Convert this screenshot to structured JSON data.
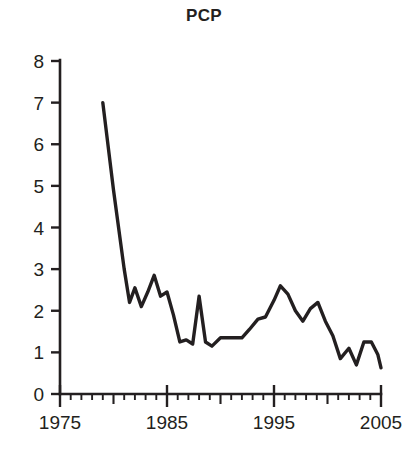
{
  "chart": {
    "title": "PCP"
  },
  "chart_data": {
    "type": "line",
    "title": "PCP",
    "xlabel": "",
    "ylabel": "",
    "xlim": [
      1975,
      2005
    ],
    "ylim": [
      0,
      8
    ],
    "grid": false,
    "legend": null,
    "x_ticks": [
      1975,
      1985,
      1995,
      2005
    ],
    "x_tick_labels": [
      "1975",
      "1985",
      "1995",
      "2005"
    ],
    "x_minor_tick_step": 1,
    "x_mid_tick_step": 5,
    "y_ticks": [
      0,
      1,
      2,
      3,
      4,
      5,
      6,
      7,
      8
    ],
    "y_tick_labels": [
      "0",
      "1",
      "2",
      "3",
      "4",
      "5",
      "6",
      "7",
      "8"
    ],
    "line_color": "#231f20",
    "x": [
      1979,
      1980,
      1981,
      1981.5,
      1982,
      1982.6,
      1983.2,
      1983.8,
      1984.4,
      1985,
      1985.6,
      1986.2,
      1986.8,
      1987.4,
      1988,
      1988.6,
      1989.2,
      1990,
      1990.6,
      1991.3,
      1992,
      1992.7,
      1993.5,
      1994.2,
      1995,
      1995.6,
      1996.3,
      1997,
      1997.7,
      1998.4,
      1999.1,
      1999.8,
      2000.5,
      2001.2,
      2002,
      2002.7,
      2003.4,
      2004.1,
      2004.7,
      2005
    ],
    "y": [
      7.0,
      4.9,
      3.0,
      2.2,
      2.55,
      2.1,
      2.45,
      2.85,
      2.35,
      2.45,
      1.9,
      1.25,
      1.3,
      1.2,
      2.35,
      1.25,
      1.15,
      1.35,
      1.35,
      1.35,
      1.35,
      1.55,
      1.8,
      1.85,
      2.25,
      2.6,
      2.4,
      2.0,
      1.75,
      2.05,
      2.2,
      1.75,
      1.4,
      0.85,
      1.1,
      0.7,
      1.25,
      1.25,
      0.95,
      0.63
    ],
    "series": [
      {
        "name": "PCP",
        "points": [
          {
            "x": 1979,
            "y": 7.0
          },
          {
            "x": 1980,
            "y": 4.9
          },
          {
            "x": 1981,
            "y": 3.0
          },
          {
            "x": 1981.5,
            "y": 2.2
          },
          {
            "x": 1982,
            "y": 2.55
          },
          {
            "x": 1982.6,
            "y": 2.1
          },
          {
            "x": 1983.2,
            "y": 2.45
          },
          {
            "x": 1983.8,
            "y": 2.85
          },
          {
            "x": 1984.4,
            "y": 2.35
          },
          {
            "x": 1985,
            "y": 2.45
          },
          {
            "x": 1985.6,
            "y": 1.9
          },
          {
            "x": 1986.2,
            "y": 1.25
          },
          {
            "x": 1986.8,
            "y": 1.3
          },
          {
            "x": 1987.4,
            "y": 1.2
          },
          {
            "x": 1988,
            "y": 2.35
          },
          {
            "x": 1988.6,
            "y": 1.25
          },
          {
            "x": 1989.2,
            "y": 1.15
          },
          {
            "x": 1990,
            "y": 1.35
          },
          {
            "x": 1990.6,
            "y": 1.35
          },
          {
            "x": 1991.3,
            "y": 1.35
          },
          {
            "x": 1992,
            "y": 1.35
          },
          {
            "x": 1992.7,
            "y": 1.55
          },
          {
            "x": 1993.5,
            "y": 1.8
          },
          {
            "x": 1994.2,
            "y": 1.85
          },
          {
            "x": 1995,
            "y": 2.25
          },
          {
            "x": 1995.6,
            "y": 2.6
          },
          {
            "x": 1996.3,
            "y": 2.4
          },
          {
            "x": 1997,
            "y": 2.0
          },
          {
            "x": 1997.7,
            "y": 1.75
          },
          {
            "x": 1998.4,
            "y": 2.05
          },
          {
            "x": 1999.1,
            "y": 2.2
          },
          {
            "x": 1999.8,
            "y": 1.75
          },
          {
            "x": 2000.5,
            "y": 1.4
          },
          {
            "x": 2001.2,
            "y": 0.85
          },
          {
            "x": 2002,
            "y": 1.1
          },
          {
            "x": 2002.7,
            "y": 0.7
          },
          {
            "x": 2003.4,
            "y": 1.25
          },
          {
            "x": 2004.1,
            "y": 1.25
          },
          {
            "x": 2004.7,
            "y": 0.95
          },
          {
            "x": 2005,
            "y": 0.63
          }
        ]
      }
    ]
  }
}
